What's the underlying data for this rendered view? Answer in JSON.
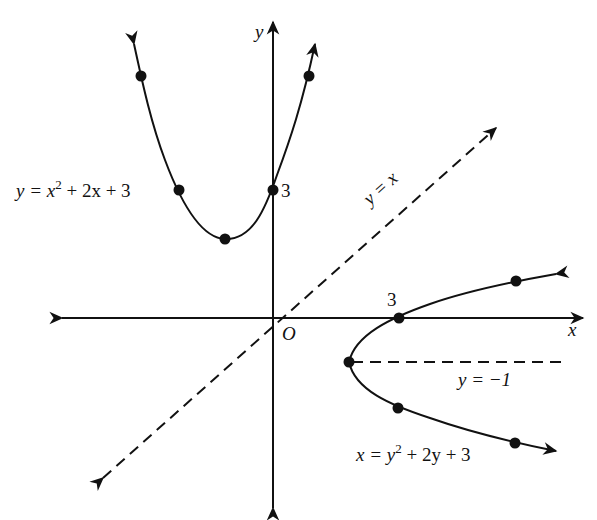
{
  "diagram": {
    "type": "coordinate-plane-graph",
    "axes": {
      "x_label": "x",
      "y_label": "y",
      "origin_label": "O",
      "origin_px": [
        273,
        318
      ]
    },
    "curves": [
      {
        "name": "upward-parabola",
        "equation": "y = x² + 2x + 3",
        "label_parts": {
          "lhs": "y = x",
          "sup": "2",
          "rhs": " + 2x + 3"
        },
        "vertex": [
          -1,
          2
        ],
        "y_intercept": 3,
        "y_intercept_label": "3",
        "points_px": [
          [
            141,
            76
          ],
          [
            179,
            190
          ],
          [
            225,
            239
          ],
          [
            272,
            190
          ],
          [
            309,
            76
          ]
        ]
      },
      {
        "name": "rightward-parabola",
        "equation": "x = y² + 2y + 3",
        "label_parts": {
          "lhs": "x = y",
          "sup": "2",
          "rhs": " + 2y + 3"
        },
        "vertex": [
          2,
          -1
        ],
        "x_intercept": 3,
        "x_intercept_label": "3",
        "points_px": [
          [
            516,
            281
          ],
          [
            399,
            318
          ],
          [
            349,
            362
          ],
          [
            398,
            408
          ],
          [
            515,
            443
          ]
        ]
      }
    ],
    "lines": [
      {
        "name": "line-of-reflection",
        "equation": "y = x",
        "label": "y = x",
        "style": "dashed"
      },
      {
        "name": "axis-of-symmetry",
        "equation": "y = −1",
        "label": "y = −1",
        "style": "dashed"
      }
    ],
    "colors": {
      "ink": "#111111",
      "background": "#ffffff"
    }
  }
}
